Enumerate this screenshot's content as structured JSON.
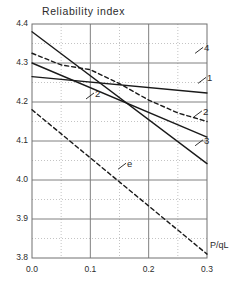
{
  "chart_data": {
    "type": "line",
    "title": "Reliability  index",
    "xlabel": "P/qL",
    "ylabel": "Reliability index",
    "xlim": [
      0.0,
      0.3
    ],
    "ylim": [
      3.8,
      4.4
    ],
    "x_ticks": [
      "0.0",
      "0.1",
      "0.2",
      "0.3"
    ],
    "x_tick_values": [
      0.0,
      0.1,
      0.2,
      0.3
    ],
    "x_minor_step": 0.05,
    "y_ticks": [
      "3.8",
      "3.9",
      "4.0",
      "4.1",
      "4.2",
      "4.3",
      "4.4"
    ],
    "y_tick_values": [
      3.8,
      3.9,
      4.0,
      4.1,
      4.2,
      4.3,
      4.4
    ],
    "y_minor_step": 0.05,
    "grid": true,
    "grid_major_color": "#808080",
    "grid_minor_color": "#aaaaaa",
    "legend": "inline-labels",
    "series": [
      {
        "name": "1",
        "style": "solid",
        "color": "#1a1a1a",
        "x": [
          0.0,
          0.3
        ],
        "y": [
          4.265,
          4.223
        ]
      },
      {
        "name": "2",
        "style": "solid",
        "color": "#1a1a1a",
        "x": [
          0.0,
          0.3
        ],
        "y": [
          4.3,
          4.11
        ]
      },
      {
        "name": "3",
        "style": "solid",
        "color": "#1a1a1a",
        "x": [
          0.0,
          0.3
        ],
        "y": [
          4.38,
          4.042
        ]
      },
      {
        "name": "4",
        "style": "dashed",
        "color": "#1a1a1a",
        "x": [
          0.0,
          0.05,
          0.1,
          0.15,
          0.2,
          0.25,
          0.3
        ],
        "y": [
          4.325,
          4.295,
          4.283,
          4.247,
          4.205,
          4.172,
          4.15
        ]
      },
      {
        "name": "e",
        "style": "dashed",
        "color": "#1a1a1a",
        "x": [
          0.0,
          0.3
        ],
        "y": [
          4.18,
          3.81
        ]
      }
    ],
    "annotations": [
      {
        "text": "4",
        "x": 0.295,
        "y": 4.335
      },
      {
        "text": "1",
        "x": 0.3,
        "y": 4.258
      },
      {
        "text": "2",
        "x": 0.293,
        "y": 4.172
      },
      {
        "text": "3",
        "x": 0.295,
        "y": 4.098
      },
      {
        "text": "2",
        "x": 0.108,
        "y": 4.218
      },
      {
        "text": "e",
        "x": 0.163,
        "y": 4.038
      }
    ]
  }
}
